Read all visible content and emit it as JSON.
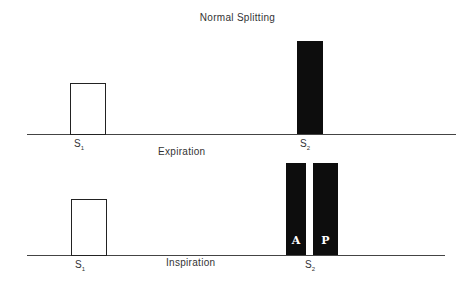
{
  "title": "Normal Splitting",
  "panels": [
    {
      "phase": "Expiration",
      "s1_label": "S",
      "s1_sub": "1",
      "s2_label": "S",
      "s2_sub": "2",
      "s2_components": "single"
    },
    {
      "phase": "Inspiration",
      "s1_label": "S",
      "s1_sub": "1",
      "s2_label": "S",
      "s2_sub": "2",
      "s2_components": [
        "A",
        "P"
      ]
    }
  ],
  "colors": {
    "bar": "#0d0d0d",
    "outline": "#222222",
    "baseline": "#444444"
  }
}
